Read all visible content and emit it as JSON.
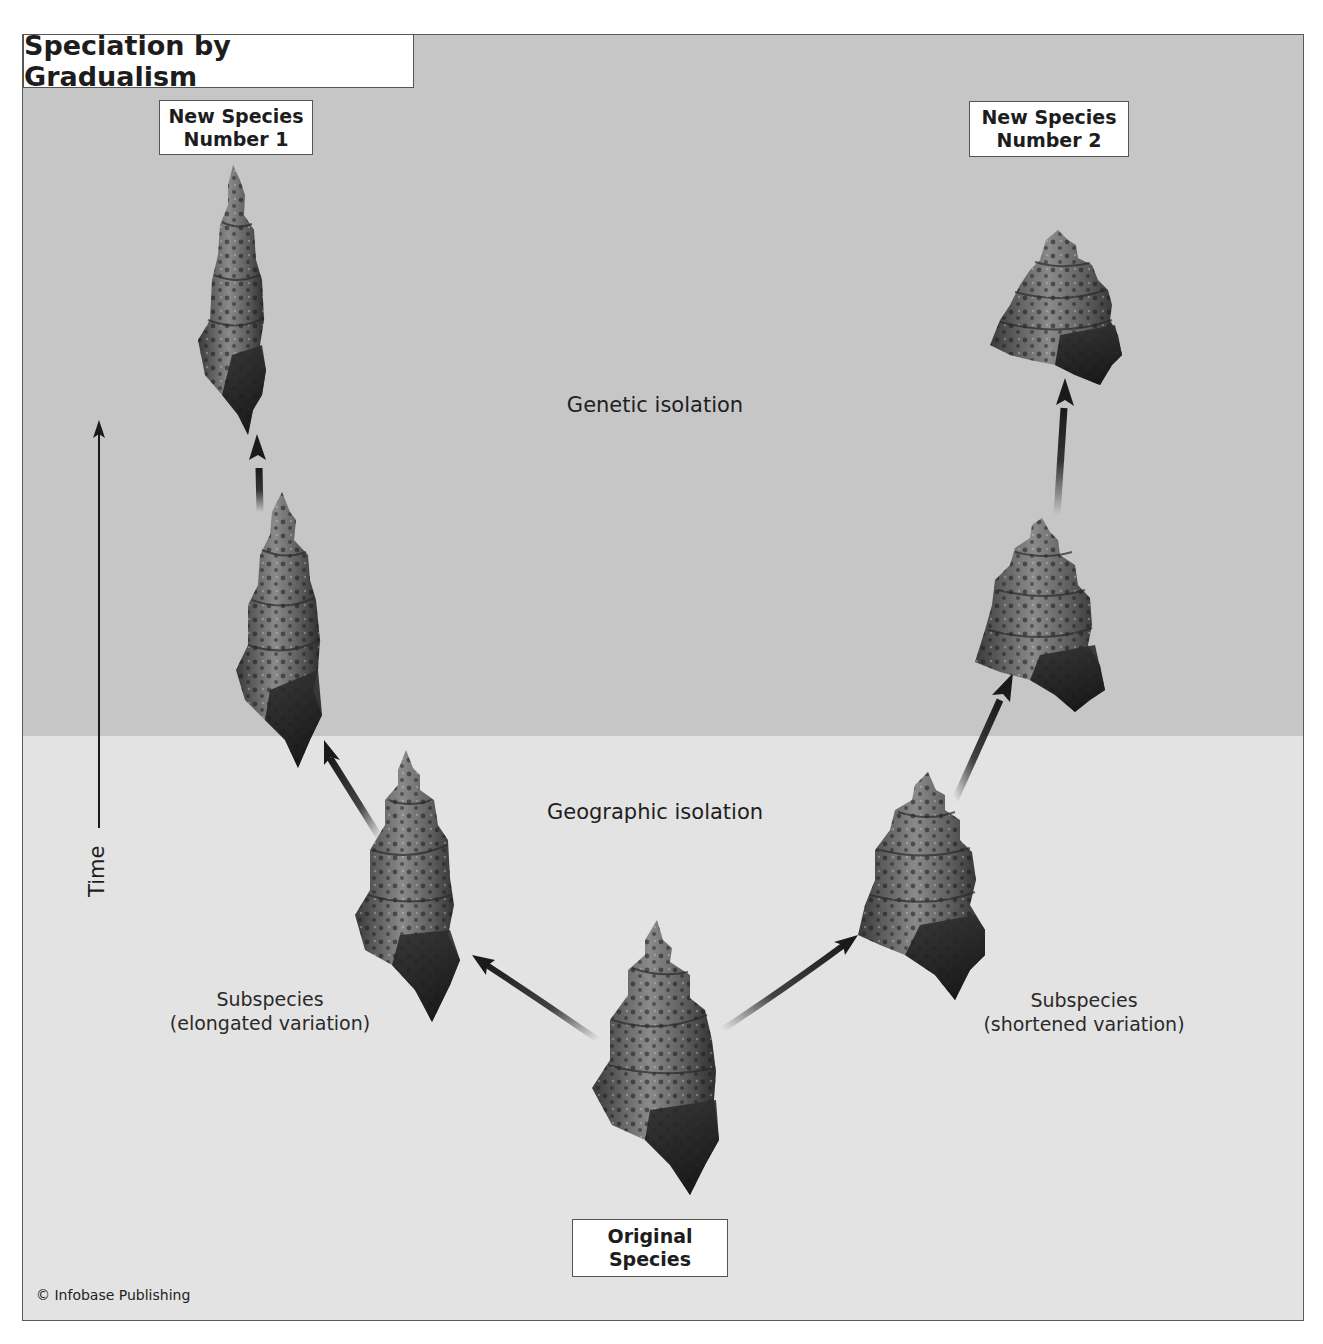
{
  "title": "Speciation by Gradualism",
  "zones": {
    "upper": {
      "label": "Genetic isolation",
      "color": "#c6c6c6"
    },
    "lower": {
      "label": "Geographic isolation",
      "color": "#e3e3e3"
    }
  },
  "labels": {
    "new_species_1": [
      "New Species",
      "Number 1"
    ],
    "new_species_2": [
      "New Species",
      "Number 2"
    ],
    "original_species": [
      "Original",
      "Species"
    ],
    "subspecies_left": [
      "Subspecies",
      "(elongated variation)"
    ],
    "subspecies_right": [
      "Subspecies",
      "(shortened variation)"
    ]
  },
  "axis": {
    "time_label": "Time"
  },
  "shells": [
    {
      "id": "original",
      "description": "original species shell",
      "lineage": "root"
    },
    {
      "id": "left-1",
      "description": "elongated subspecies",
      "lineage": "left"
    },
    {
      "id": "left-2",
      "description": "more elongated shell",
      "lineage": "left"
    },
    {
      "id": "left-3",
      "description": "new species number 1 (very elongated)",
      "lineage": "left"
    },
    {
      "id": "right-1",
      "description": "shortened subspecies",
      "lineage": "right"
    },
    {
      "id": "right-2",
      "description": "more shortened shell",
      "lineage": "right"
    },
    {
      "id": "right-3",
      "description": "new species number 2 (very shortened)",
      "lineage": "right"
    }
  ],
  "credit": "© Infobase Publishing",
  "colors": {
    "arrow": "#1a1a1a",
    "shell_dark": "#2a2a2a",
    "shell_mid": "#6e6e6e",
    "shell_light": "#a8a8a8",
    "border": "#555555"
  }
}
